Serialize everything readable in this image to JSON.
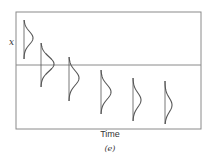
{
  "figure": {
    "y_label": "x",
    "x_label": "Time",
    "caption": "(e)",
    "colors": {
      "frame": "#8a8a8a",
      "curve": "#555555",
      "text": "#333333"
    }
  },
  "diagram": {
    "frame": {
      "left": 16,
      "top": 12,
      "right": 201,
      "bottom": 129
    },
    "reference_line_y": 65,
    "distributions": [
      {
        "x": 24,
        "top": 20,
        "bottom": 59,
        "peak_x": 33,
        "peak_y": 38
      },
      {
        "x": 41,
        "top": 43,
        "bottom": 87,
        "peak_x": 54,
        "peak_y": 64
      },
      {
        "x": 69,
        "top": 57,
        "bottom": 101,
        "peak_x": 79,
        "peak_y": 78
      },
      {
        "x": 101,
        "top": 70,
        "bottom": 114,
        "peak_x": 111,
        "peak_y": 92
      },
      {
        "x": 133,
        "top": 78,
        "bottom": 121,
        "peak_x": 141,
        "peak_y": 100
      },
      {
        "x": 165,
        "top": 81,
        "bottom": 124,
        "peak_x": 172,
        "peak_y": 105
      }
    ]
  }
}
